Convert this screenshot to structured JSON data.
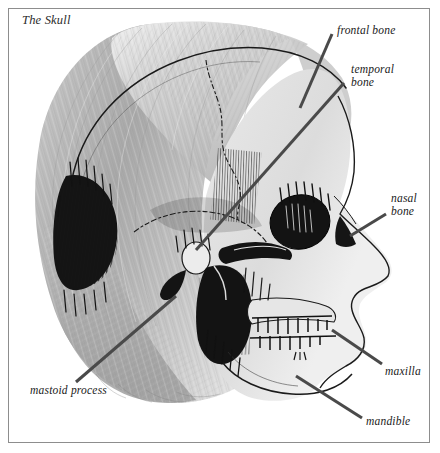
{
  "figure": {
    "title": "The Skull",
    "caption_style": "italic-serif",
    "border_color": "#8d8d8d",
    "background_color": "#ffffff",
    "ink_color": "#111111",
    "hair_tone_light": "#e8e8e8",
    "hair_tone_mid": "#b9b9b9",
    "hair_tone_dark": "#8a8a8a",
    "leader_line_color": "#4a4a4a"
  },
  "labels": [
    {
      "id": "frontal",
      "text": "frontal bone",
      "lines": [
        "frontal bone"
      ]
    },
    {
      "id": "temporal",
      "text": "temporal bone",
      "lines": [
        "temporal",
        "bone"
      ]
    },
    {
      "id": "nasal",
      "text": "nasal bone",
      "lines": [
        "nasal",
        "bone"
      ]
    },
    {
      "id": "maxilla",
      "text": "maxilla",
      "lines": [
        "maxilla"
      ]
    },
    {
      "id": "mandible",
      "text": "mandible",
      "lines": [
        "mandible"
      ]
    },
    {
      "id": "mastoid",
      "text": "mastoid process",
      "lines": [
        "mastoid process"
      ]
    }
  ],
  "label_text": {
    "frontal": "frontal bone",
    "temporal_line1": "temporal",
    "temporal_line2": "bone",
    "nasal_line1": "nasal",
    "nasal_line2": "bone",
    "maxilla": "maxilla",
    "mandible": "mandible",
    "mastoid": "mastoid process"
  }
}
